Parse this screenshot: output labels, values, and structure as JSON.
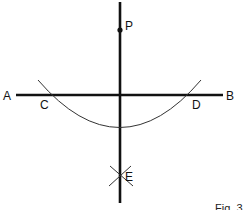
{
  "figure": {
    "caption": "Fig. 3",
    "labels": {
      "A": "A",
      "B": "B",
      "C": "C",
      "D": "D",
      "E": "E",
      "P": "P"
    }
  },
  "diagram": {
    "line_AB": {
      "from": "A",
      "to": "B"
    },
    "perpendicular": {
      "through": [
        "P",
        "E"
      ]
    },
    "arc": {
      "center": "P",
      "intersects": [
        "C",
        "D"
      ]
    },
    "arc_intersection": "E"
  }
}
